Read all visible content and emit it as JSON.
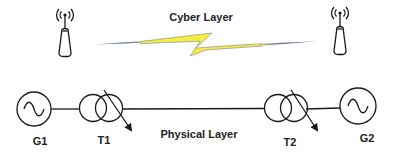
{
  "diagram": {
    "cyber_layer": {
      "title": "Cyber Layer",
      "link_colors": {
        "bolt_fill": "#f5ee3c",
        "bolt_outline": "#9a9a9a",
        "tail_blue": "#4a5aa8"
      },
      "nodes": [
        {
          "id": "antenna-left",
          "icon": "radio-antenna-icon"
        },
        {
          "id": "antenna-right",
          "icon": "radio-antenna-icon"
        }
      ]
    },
    "physical_layer": {
      "title": "Physical Layer",
      "components": [
        {
          "id": "G1",
          "label": "G1",
          "type": "generator",
          "icon": "ac-generator-icon"
        },
        {
          "id": "T1",
          "label": "T1",
          "type": "transformer",
          "icon": "tap-changing-transformer-icon"
        },
        {
          "id": "T2",
          "label": "T2",
          "type": "transformer",
          "icon": "tap-changing-transformer-icon"
        },
        {
          "id": "G2",
          "label": "G2",
          "type": "generator",
          "icon": "ac-generator-icon"
        }
      ],
      "connections": [
        [
          "G1",
          "T1"
        ],
        [
          "T1",
          "T2"
        ],
        [
          "T2",
          "G2"
        ]
      ]
    }
  }
}
